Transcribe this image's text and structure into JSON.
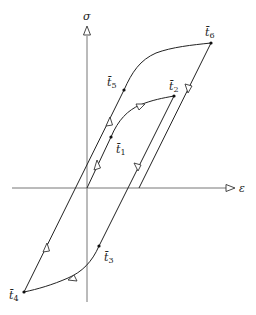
{
  "diagram": {
    "type": "stress-strain hysteresis diagram",
    "axes": {
      "x_label": "ε",
      "y_label": "σ"
    },
    "points": [
      {
        "id": "t1",
        "label": "t̄",
        "sub": "1"
      },
      {
        "id": "t2",
        "label": "t̄",
        "sub": "2"
      },
      {
        "id": "t3",
        "label": "t̄",
        "sub": "3"
      },
      {
        "id": "t4",
        "label": "t̄",
        "sub": "4"
      },
      {
        "id": "t5",
        "label": "t̄",
        "sub": "5"
      },
      {
        "id": "t6",
        "label": "t̄",
        "sub": "6"
      }
    ],
    "colors": {
      "axis": "#777777",
      "curve": "#222222",
      "background": "#ffffff"
    }
  }
}
